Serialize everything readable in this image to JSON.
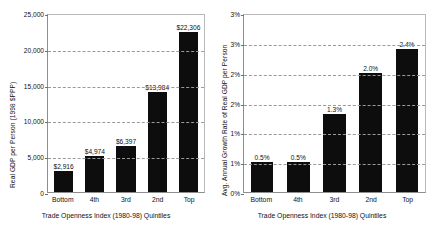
{
  "chart_data": [
    {
      "type": "bar",
      "panel": "left",
      "title": "",
      "xlabel": "Trade Openness Index (1980-98) Quintiles",
      "ylabel": "Real GDP per Person (1998 $PPP)",
      "categories": [
        "Bottom",
        "4th",
        "3rd",
        "2nd",
        "Top"
      ],
      "values": [
        2916,
        4974,
        6397,
        13984,
        22306
      ],
      "value_labels": [
        "$2,916",
        "$4,974",
        "$6,397",
        "$13,984",
        "$22,306"
      ],
      "ylim": [
        0,
        25000
      ],
      "yticks": [
        0,
        5000,
        10000,
        15000,
        20000,
        25000
      ],
      "ytick_labels": [
        "0",
        "5,000",
        "10,000",
        "15,000",
        "20,000",
        "25,000"
      ],
      "grid": true,
      "legend": "none",
      "bar_color": "#0d0d0d"
    },
    {
      "type": "bar",
      "panel": "right",
      "title": "",
      "xlabel": "Trade Openness Index (1980-98) Quintiles",
      "ylabel": "Avg. Annual Growth Rate of Real GDP per Person",
      "categories": [
        "Bottom",
        "4th",
        "3rd",
        "2nd",
        "Top"
      ],
      "values": [
        0.5,
        0.5,
        1.3,
        2.0,
        2.4
      ],
      "value_labels": [
        "0.5%",
        "0.5%",
        "1.3%",
        "2.0%",
        "2.4%"
      ],
      "ylim": [
        0,
        3
      ],
      "yticks": [
        0,
        0.5,
        1.0,
        1.5,
        2.0,
        2.5,
        3.0
      ],
      "ytick_labels": [
        "0%",
        "1%",
        "1%",
        "2%",
        "2%",
        "3%",
        "3%"
      ],
      "grid": true,
      "legend": "none",
      "bar_color": "#0d0d0d"
    }
  ]
}
